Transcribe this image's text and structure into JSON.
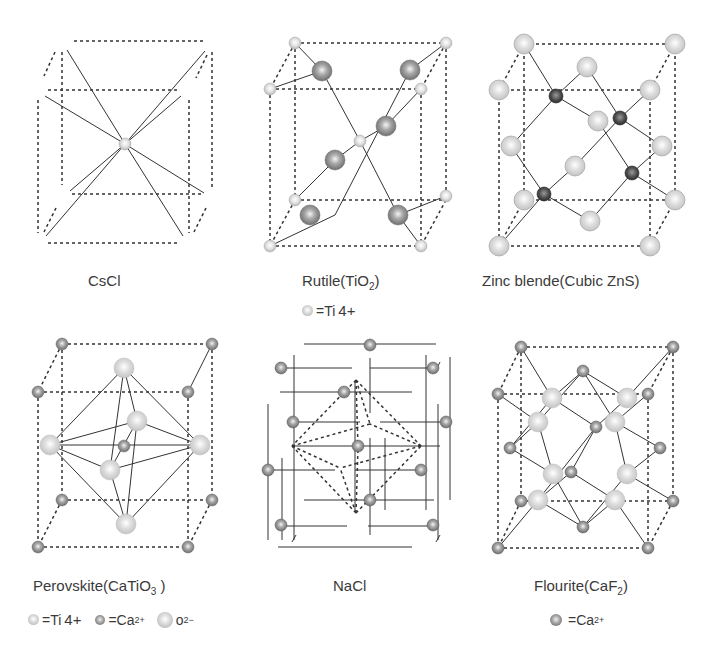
{
  "figure": {
    "structures": [
      {
        "id": "cscl",
        "name": "CsCl",
        "subscript": ""
      },
      {
        "id": "rutile",
        "name": "Rutile(TiO",
        "subscript": "2",
        "suffix": ")"
      },
      {
        "id": "zincblende",
        "name": "Zinc blende(Cubic ZnS)",
        "subscript": ""
      },
      {
        "id": "perovskite",
        "name": "Perovskite(CaTiO",
        "subscript": "3",
        "suffix": " )"
      },
      {
        "id": "nacl",
        "name": "NaCl",
        "subscript": ""
      },
      {
        "id": "fluorite",
        "name": "Flourite(CaF",
        "subscript": "2",
        "suffix": ")"
      }
    ],
    "legends": {
      "rutile": [
        {
          "symbol": "=Ti",
          "charge": "4+"
        }
      ],
      "perovskite": [
        {
          "symbol": "=Ti",
          "charge": "4+"
        },
        {
          "symbol": "=Ca",
          "charge": "2+"
        },
        {
          "symbol": "o",
          "charge": "2−"
        }
      ],
      "fluorite": [
        {
          "symbol": "=Ca",
          "charge": "2+"
        }
      ]
    },
    "colors": {
      "light_atom": "#d9d9d9",
      "mid_atom": "#9a9a9a",
      "dark_atom": "#555555",
      "line": "#333333"
    }
  }
}
